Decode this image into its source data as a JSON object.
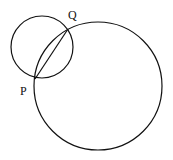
{
  "diagram": {
    "labels": {
      "P": "P",
      "Q": "Q"
    },
    "small_circle": {
      "cx": 42,
      "cy": 47,
      "r": 31
    },
    "large_circle": {
      "cx": 98,
      "cy": 86,
      "r": 64
    },
    "points": {
      "P": {
        "x": 35,
        "y": 79
      },
      "Q": {
        "x": 68,
        "y": 29
      }
    },
    "chord": "PQ",
    "stroke_color": "#111111"
  }
}
